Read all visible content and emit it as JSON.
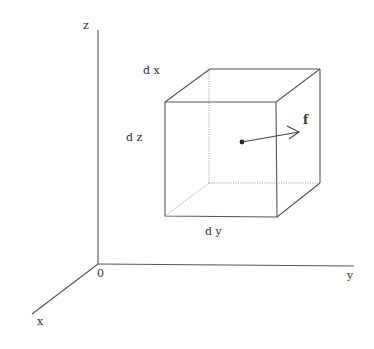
{
  "figure": {
    "labels": {
      "z_axis": "z",
      "y_axis": "y",
      "x_axis": "x",
      "origin": "0",
      "dx": "d x",
      "dy": "d y",
      "dz": "d z",
      "force": "f"
    },
    "colors": {
      "line": "#555555",
      "hidden_line": "#9a9a9a",
      "text": "#333333",
      "background": "#ffffff"
    }
  }
}
